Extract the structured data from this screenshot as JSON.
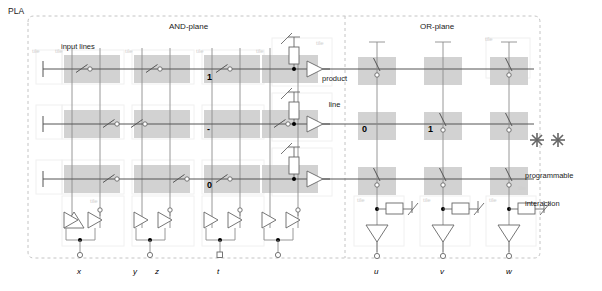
{
  "diagram": {
    "title": "PLA",
    "planes": [
      {
        "name": "and_plane",
        "label": "AND-plane"
      },
      {
        "name": "or_plane",
        "label": "OR-plane"
      }
    ],
    "annotations": {
      "input_lines": "input lines",
      "product_line": "product\nline",
      "product_line_l1": "product",
      "product_line_l2": "line",
      "legend_l1": "programmable",
      "legend_l2": "interaction"
    },
    "tile_label": "tile",
    "colors": {
      "tile_fill": "#d0d0d0",
      "tile_fill_light": "#efefef",
      "wire": "#555555",
      "thin_wire": "#8c8c8c",
      "dashed_border": "#c8c8c8",
      "tile_text": "#cfcfcf",
      "text": "#1a1a1a"
    },
    "and_plane": {
      "input_columns": [
        {
          "var": "x",
          "label": "x"
        },
        {
          "var": "y",
          "label": "y"
        },
        {
          "var": "z",
          "label": "z"
        },
        {
          "var": "t",
          "label": "t"
        }
      ],
      "extra_input_label": {
        "label": "z"
      },
      "rows": [
        {
          "index": 0,
          "programmed": [
            {
              "col": 0,
              "bit": "",
              "switch": true
            },
            {
              "col": 1,
              "bit": "",
              "switch": true
            },
            {
              "col": 2,
              "bit": "1",
              "switch": true
            },
            {
              "col": 3,
              "bit": "",
              "switch": false
            }
          ]
        },
        {
          "index": 1,
          "programmed": [
            {
              "col": 0,
              "bit": "",
              "switch": true
            },
            {
              "col": 1,
              "bit": "",
              "switch": true
            },
            {
              "col": 2,
              "bit": "-",
              "switch": false
            },
            {
              "col": 3,
              "bit": "",
              "switch": true
            }
          ]
        },
        {
          "index": 2,
          "programmed": [
            {
              "col": 0,
              "bit": "",
              "switch": true
            },
            {
              "col": 1,
              "bit": "",
              "switch": true
            },
            {
              "col": 2,
              "bit": "0",
              "switch": true
            },
            {
              "col": 3,
              "bit": "",
              "switch": false
            }
          ]
        }
      ]
    },
    "or_plane": {
      "output_columns": [
        {
          "var": "u",
          "label": "u"
        },
        {
          "var": "v",
          "label": "v"
        },
        {
          "var": "w",
          "label": "w"
        }
      ],
      "rows": [
        {
          "index": 0,
          "cells": [
            {
              "col": 0,
              "bit": "",
              "switch": true
            },
            {
              "col": 1,
              "bit": "",
              "switch": false
            },
            {
              "col": 2,
              "bit": "",
              "switch": true
            }
          ]
        },
        {
          "index": 1,
          "cells": [
            {
              "col": 0,
              "bit": "0",
              "switch": false
            },
            {
              "col": 1,
              "bit": "1",
              "switch": true
            },
            {
              "col": 2,
              "bit": "",
              "switch": true
            }
          ]
        },
        {
          "index": 2,
          "cells": [
            {
              "col": 0,
              "bit": "",
              "switch": true
            },
            {
              "col": 1,
              "bit": "",
              "switch": true
            },
            {
              "col": 2,
              "bit": "",
              "switch": true
            }
          ]
        }
      ]
    },
    "product_rows": 3
  }
}
